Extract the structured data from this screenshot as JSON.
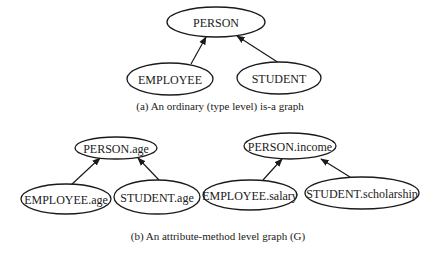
{
  "figure": {
    "graph_a": {
      "caption": "(a) An ordinary (type level) is-a graph",
      "caption_pos": {
        "x": 220,
        "y": 100
      },
      "nodes": [
        {
          "id": "person",
          "label": "PERSON",
          "cx": 216,
          "cy": 22,
          "rx": 49,
          "ry": 15
        },
        {
          "id": "employee",
          "label": "EMPLOYEE",
          "cx": 170,
          "cy": 79,
          "rx": 43,
          "ry": 16
        },
        {
          "id": "student",
          "label": "STUDENT",
          "cx": 279,
          "cy": 78,
          "rx": 42,
          "ry": 16
        }
      ],
      "edges": [
        {
          "from": "employee",
          "to": "person",
          "x1": 191,
          "y1": 64,
          "x2": 206,
          "y2": 37
        },
        {
          "from": "student",
          "to": "person",
          "x1": 279,
          "y1": 63,
          "x2": 237,
          "y2": 36
        }
      ]
    },
    "graph_b": {
      "caption": "(b) An attribute-method level graph (G)",
      "caption_pos": {
        "x": 218,
        "y": 230
      },
      "subgraphs": [
        {
          "nodes": [
            {
              "id": "person_age",
              "label": "PERSON.age",
              "cx": 116,
              "cy": 148,
              "rx": 41,
              "ry": 11
            },
            {
              "id": "employee_age",
              "label": "EMPLOYEE.age",
              "cx": 66,
              "cy": 199,
              "rx": 45,
              "ry": 15
            },
            {
              "id": "student_age",
              "label": "STUDENT.age",
              "cx": 157,
              "cy": 197,
              "rx": 43,
              "ry": 17
            }
          ],
          "edges": [
            {
              "from": "employee_age",
              "to": "person_age",
              "x1": 70,
              "y1": 186,
              "x2": 100,
              "y2": 158
            },
            {
              "from": "student_age",
              "to": "person_age",
              "x1": 159,
              "y1": 180,
              "x2": 138,
              "y2": 158
            }
          ]
        },
        {
          "nodes": [
            {
              "id": "person_income",
              "label": "PERSON.income",
              "cx": 290,
              "cy": 146,
              "rx": 46,
              "ry": 13
            },
            {
              "id": "employee_salary",
              "label": "EMPLOYEE.salary",
              "cx": 250,
              "cy": 195,
              "rx": 47,
              "ry": 15
            },
            {
              "id": "student_scholarship",
              "label": "STUDENT.scholarship",
              "cx": 362,
              "cy": 193,
              "rx": 57,
              "ry": 16
            }
          ],
          "edges": [
            {
              "from": "employee_salary",
              "to": "person_income",
              "x1": 263,
              "y1": 180,
              "x2": 282,
              "y2": 159
            },
            {
              "from": "student_scholarship",
              "to": "person_income",
              "x1": 350,
              "y1": 177,
              "x2": 321,
              "y2": 159
            }
          ]
        }
      ]
    },
    "colors": {
      "stroke": "#1a1a1a",
      "background": "#ffffff"
    }
  }
}
